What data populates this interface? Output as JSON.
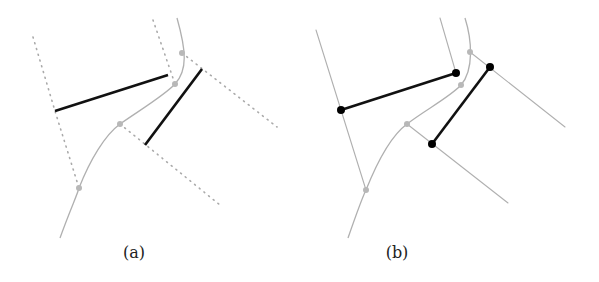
{
  "panels": [
    {
      "id": "a",
      "caption": "(a)",
      "caption_pos": [
        134,
        243
      ],
      "curve": "M60,238 C70,210 78,193 79,188 C90,160 105,135 120,124 C140,110 165,95 175,84 C188,70 186,50 177,18",
      "curve_points": [
        [
          79,
          188
        ],
        [
          120,
          124
        ],
        [
          175,
          84
        ],
        [
          182,
          53
        ]
      ],
      "dotted_lines": [
        [
          [
            33,
            37
          ],
          [
            55,
            111
          ],
          [
            79,
            188
          ]
        ],
        [
          [
            153,
            20
          ],
          [
            175,
            84
          ]
        ],
        [
          [
            182,
            53
          ],
          [
            277,
            127
          ]
        ],
        [
          [
            120,
            124
          ],
          [
            220,
            205
          ]
        ]
      ],
      "segments": [
        [
          [
            55,
            111
          ],
          [
            168,
            75
          ]
        ],
        [
          [
            145,
            145
          ],
          [
            202,
            69
          ]
        ]
      ],
      "show_endpoints": false,
      "line_style": "dotted"
    },
    {
      "id": "b",
      "caption": "(b)",
      "caption_pos": [
        397,
        243
      ],
      "curve": "M348,238 C356,215 362,198 366,190 C378,160 392,135 407,124 C425,110 450,97 461,85 C474,70 472,40 465,18",
      "curve_points": [
        [
          366,
          190
        ],
        [
          407,
          124
        ],
        [
          461,
          85
        ],
        [
          470,
          52
        ]
      ],
      "guide_lines": [
        [
          [
            316,
            30
          ],
          [
            341,
            110
          ],
          [
            366,
            190
          ]
        ],
        [
          [
            440,
            18
          ],
          [
            456,
            73
          ]
        ],
        [
          [
            470,
            52
          ],
          [
            565,
            127
          ]
        ],
        [
          [
            407,
            124
          ],
          [
            508,
            203
          ]
        ]
      ],
      "segments": [
        [
          [
            341,
            110
          ],
          [
            456,
            73
          ]
        ],
        [
          [
            432,
            144
          ],
          [
            490,
            67
          ]
        ]
      ],
      "show_endpoints": true,
      "line_style": "solid"
    }
  ],
  "colors": {
    "curve": "#b0b0b0",
    "guide": "#b0b0b0",
    "dotted": "#aaaaaa",
    "segment": "#111111",
    "curve_point": "#b8b8b8",
    "endpoint": "#000000"
  }
}
